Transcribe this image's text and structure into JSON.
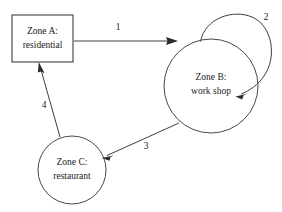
{
  "diagram": {
    "background_color": "#ffffff",
    "stroke_color": "#3d3d3d",
    "text_color": "#1a1a1a",
    "nodes": [
      {
        "id": "zone-a",
        "shape": "rectangle",
        "line1": "Zone A:",
        "line2": "residential",
        "x": 12,
        "y": 15,
        "width": 61,
        "height": 47
      },
      {
        "id": "zone-b",
        "shape": "circle",
        "line1": "Zone B:",
        "line2": "work shop",
        "cx": 211,
        "cy": 86,
        "r": 47
      },
      {
        "id": "zone-c",
        "shape": "circle",
        "line1": "Zone C:",
        "line2": "restaurant",
        "cx": 72,
        "cy": 170,
        "r": 34
      }
    ],
    "edges": [
      {
        "id": "edge-1",
        "label": "1",
        "from": "zone-a",
        "to": "zone-b",
        "label_x": 118,
        "label_y": 28
      },
      {
        "id": "edge-2",
        "label": "2",
        "from": "zone-b",
        "to": "zone-b",
        "self_loop": true,
        "label_x": 266,
        "label_y": 18
      },
      {
        "id": "edge-3",
        "label": "3",
        "from": "zone-b",
        "to": "zone-c",
        "label_x": 146,
        "label_y": 147
      },
      {
        "id": "edge-4",
        "label": "4",
        "from": "zone-c",
        "to": "zone-a",
        "label_x": 44,
        "label_y": 106
      }
    ]
  }
}
